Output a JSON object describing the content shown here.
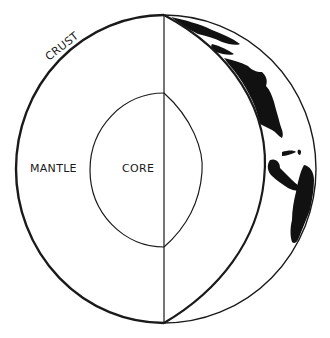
{
  "diagram": {
    "labels": {
      "crust": "CRUST",
      "mantle": "MANTLE",
      "core": "CORE"
    },
    "colors": {
      "line": "#1a1a1a",
      "land": "#111111",
      "background": "#ffffff"
    },
    "icons": {
      "globe": "globe-icon"
    }
  }
}
